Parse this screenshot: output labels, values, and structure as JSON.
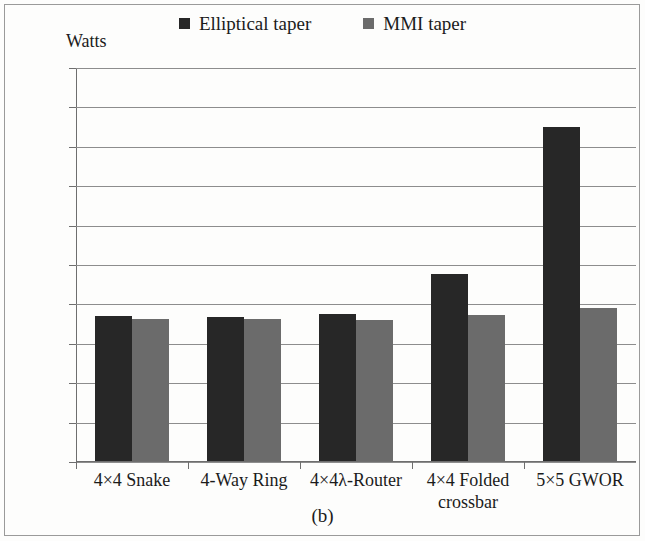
{
  "figure": {
    "caption": "(b)",
    "axis_title": "Watts"
  },
  "legend": {
    "position": "top-center",
    "entries": [
      {
        "label": "Elliptical taper",
        "color": "#272727",
        "icon": "square-swatch-icon"
      },
      {
        "label": "MMI taper",
        "color": "#6b6b6b",
        "icon": "square-swatch-icon"
      }
    ]
  },
  "chart_data": {
    "type": "bar",
    "title": "",
    "subtitle": "",
    "xlabel": "",
    "ylabel": "Watts",
    "ylim": [
      0,
      0.5
    ],
    "ytick_labels": [
      "0.5",
      "0.45",
      "0.4",
      "0.35",
      "0.3",
      "0.25",
      "0.2",
      "0.15",
      "0.1",
      "0.05",
      "0"
    ],
    "ytick_values": [
      0.5,
      0.45,
      0.4,
      0.35,
      0.3,
      0.25,
      0.2,
      0.15,
      0.1,
      0.05,
      0
    ],
    "grid": true,
    "legend_position": "top-center",
    "categories": [
      "4×4 Snake",
      "4-Way Ring",
      "4×4λ-Router",
      "4×4 Folded crossbar",
      "5×5 GWOR"
    ],
    "category_lines": [
      [
        "4×4 Snake"
      ],
      [
        "4-Way Ring"
      ],
      [
        "4×4λ-Router"
      ],
      [
        "4×4 Folded",
        "crossbar"
      ],
      [
        "5×5 GWOR"
      ]
    ],
    "series": [
      {
        "name": "Elliptical taper",
        "color": "#272727",
        "values": [
          0.185,
          0.184,
          0.188,
          0.239,
          0.425
        ]
      },
      {
        "name": "MMI taper",
        "color": "#6b6b6b",
        "values": [
          0.181,
          0.181,
          0.18,
          0.186,
          0.195
        ]
      }
    ]
  }
}
